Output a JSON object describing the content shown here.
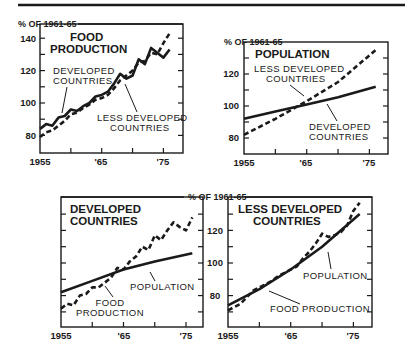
{
  "figure": {
    "rule_color": "#1a1a1a",
    "ink_color": "#1a1a1a",
    "background": "#ffffff"
  },
  "chart_data": [
    {
      "id": "food-production",
      "type": "line",
      "title": "FOOD PRODUCTION",
      "ylabel": "% OF 1961-65",
      "xlabel": "",
      "x_tick_labels": [
        "1955",
        "'65",
        "'75"
      ],
      "y_tick_labels": [
        "80",
        "100",
        "120",
        "140"
      ],
      "xlim": [
        1955,
        1977
      ],
      "ylim": [
        70,
        150
      ],
      "grid": false,
      "annotations": [
        "DEVELOPED COUNTRIES",
        "LESS DEVELOPED COUNTRIES"
      ],
      "series": [
        {
          "name": "DEVELOPED COUNTRIES",
          "style": "solid",
          "x": [
            1955,
            1956,
            1957,
            1958,
            1959,
            1960,
            1961,
            1962,
            1963,
            1964,
            1965,
            1966,
            1967,
            1968,
            1969,
            1970,
            1971,
            1972,
            1973,
            1974,
            1975,
            1976
          ],
          "values": [
            84,
            87,
            86,
            91,
            92,
            96,
            95,
            98,
            100,
            104,
            105,
            107,
            112,
            118,
            115,
            117,
            127,
            124,
            134,
            131,
            128,
            133
          ]
        },
        {
          "name": "LESS DEVELOPED COUNTRIES",
          "style": "dashed",
          "x": [
            1955,
            1956,
            1957,
            1958,
            1959,
            1960,
            1961,
            1962,
            1963,
            1964,
            1965,
            1966,
            1967,
            1968,
            1969,
            1970,
            1971,
            1972,
            1973,
            1974,
            1975,
            1976
          ],
          "values": [
            79,
            82,
            83,
            86,
            89,
            93,
            94,
            97,
            99,
            102,
            103,
            105,
            109,
            114,
            117,
            120,
            125,
            126,
            131,
            130,
            137,
            143
          ]
        }
      ]
    },
    {
      "id": "population",
      "type": "line",
      "title": "POPULATION",
      "ylabel": "% OF 1961-65",
      "xlabel": "",
      "x_tick_labels": [
        "1955",
        "'65",
        "'75"
      ],
      "y_tick_labels": [
        "80",
        "100",
        "120"
      ],
      "xlim": [
        1955,
        1977
      ],
      "ylim": [
        70,
        137
      ],
      "grid": false,
      "annotations": [
        "LESS DEVELOPED COUNTRIES",
        "DEVELOPED COUNTRIES"
      ],
      "series": [
        {
          "name": "DEVELOPED COUNTRIES",
          "style": "solid",
          "x": [
            1955,
            1960,
            1965,
            1970,
            1976
          ],
          "values": [
            92,
            96.5,
            101,
            105.5,
            112
          ]
        },
        {
          "name": "LESS DEVELOPED COUNTRIES",
          "style": "dashed",
          "x": [
            1955,
            1960,
            1965,
            1970,
            1976
          ],
          "values": [
            82,
            92,
            103,
            115,
            135
          ]
        }
      ]
    },
    {
      "id": "developed-countries",
      "type": "line",
      "title": "DEVELOPED COUNTRIES",
      "ylabel": "% OF 1961-65",
      "xlabel": "",
      "x_tick_labels": [
        "1955",
        "'65",
        "'75"
      ],
      "y_tick_labels": [
        "80",
        "100",
        "120"
      ],
      "xlim": [
        1955,
        1977
      ],
      "ylim": [
        60,
        140
      ],
      "grid": false,
      "annotations": [
        "POPULATION",
        "FOOD PRODUCTION"
      ],
      "series": [
        {
          "name": "POPULATION",
          "style": "solid",
          "x": [
            1955,
            1960,
            1965,
            1970,
            1976
          ],
          "values": [
            82,
            89,
            96,
            101,
            106
          ]
        },
        {
          "name": "FOOD PRODUCTION",
          "style": "dashed",
          "x": [
            1955,
            1956,
            1957,
            1958,
            1959,
            1960,
            1961,
            1962,
            1963,
            1964,
            1965,
            1966,
            1967,
            1968,
            1969,
            1970,
            1971,
            1972,
            1973,
            1974,
            1975,
            1976
          ],
          "values": [
            72,
            75,
            74,
            80,
            81,
            85,
            85,
            88,
            91,
            97,
            96,
            101,
            104,
            110,
            108,
            117,
            114,
            120,
            125,
            122,
            120,
            128
          ]
        }
      ]
    },
    {
      "id": "less-developed-countries",
      "type": "line",
      "title": "LESS DEVELOPED COUNTRIES",
      "ylabel": "% OF 1961-65",
      "xlabel": "",
      "x_tick_labels": [
        "1955",
        "'65",
        "'75"
      ],
      "y_tick_labels": [
        "80",
        "100",
        "120"
      ],
      "xlim": [
        1955,
        1977
      ],
      "ylim": [
        60,
        140
      ],
      "grid": false,
      "annotations": [
        "POPULATION",
        "FOOD PRODUCTION"
      ],
      "series": [
        {
          "name": "POPULATION",
          "style": "solid",
          "x": [
            1955,
            1960,
            1965,
            1970,
            1976
          ],
          "values": [
            74,
            84,
            96,
            110,
            130
          ]
        },
        {
          "name": "FOOD PRODUCTION",
          "style": "dashed",
          "x": [
            1955,
            1956,
            1957,
            1958,
            1959,
            1960,
            1961,
            1962,
            1963,
            1964,
            1965,
            1966,
            1967,
            1968,
            1969,
            1970,
            1971,
            1972,
            1973,
            1974,
            1975,
            1976
          ],
          "values": [
            71,
            73,
            75,
            79,
            83,
            85,
            87,
            89,
            92,
            94,
            96,
            98,
            103,
            107,
            112,
            118,
            116,
            117,
            119,
            123,
            132,
            137
          ]
        }
      ]
    }
  ],
  "labels": {
    "pct_base": "% OF 1961-65",
    "panel1_title_1": "FOOD",
    "panel1_title_2": "PRODUCTION",
    "panel1_ann_dev_1": "DEVELOPED",
    "panel1_ann_dev_2": "COUNTRIES",
    "panel1_ann_ldc_1": "LESS DEVELOPED",
    "panel1_ann_ldc_2": "COUNTRIES",
    "panel2_title": "POPULATION",
    "panel2_ann_ldc_1": "LESS DEVELOPED",
    "panel2_ann_ldc_2": "COUNTRIES",
    "panel2_ann_dev_1": "DEVELOPED",
    "panel2_ann_dev_2": "COUNTRIES",
    "panel3_title_1": "DEVELOPED",
    "panel3_title_2": "COUNTRIES",
    "panel3_ann_pop": "POPULATION",
    "panel3_ann_food_1": "FOOD",
    "panel3_ann_food_2": "PRODUCTION",
    "panel4_title_1": "LESS DEVELOPED",
    "panel4_title_2": "COUNTRIES",
    "panel4_ann_pop": "POPULATION",
    "panel4_ann_food": "FOOD PRODUCTION",
    "x1955": "1955",
    "x65": "'65",
    "x75": "'75",
    "y80": "80",
    "y100": "100",
    "y120": "120",
    "y140": "140"
  }
}
